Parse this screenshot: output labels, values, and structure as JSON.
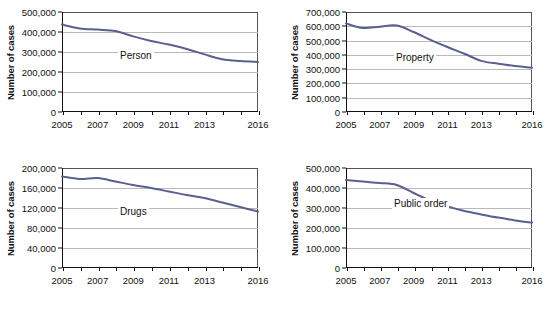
{
  "figure": {
    "layout": "2x2 grid of line charts",
    "line_color": "#5a5f8f",
    "gridline_color": "#b9b9b9",
    "axis_color": "#111111",
    "background": "#ffffff"
  },
  "chart_data": [
    {
      "type": "line",
      "title": "",
      "series_label": "Person",
      "xlabel": "",
      "ylabel": "Number of cases",
      "x": [
        2005,
        2006,
        2007,
        2008,
        2009,
        2010,
        2011,
        2012,
        2013,
        2014,
        2015,
        2016
      ],
      "values": [
        437000,
        418000,
        412000,
        405000,
        378000,
        355000,
        337000,
        315000,
        288000,
        264000,
        255000,
        250000
      ],
      "xlim": [
        2005,
        2016
      ],
      "ylim": [
        0,
        500000
      ],
      "yticks": [
        0,
        100000,
        200000,
        300000,
        400000,
        500000
      ],
      "ytick_labels": [
        "0",
        "100,000",
        "200,000",
        "300,000",
        "400,000",
        "500,000"
      ],
      "xticks": [
        2005,
        2006,
        2007,
        2008,
        2009,
        2010,
        2011,
        2012,
        2013,
        2014,
        2015,
        2016
      ],
      "xtick_labels": [
        "2005",
        "",
        "2007",
        "",
        "2009",
        "",
        "2011",
        "",
        "2013",
        "",
        "",
        "2016"
      ],
      "grid": true,
      "legend": "inline-label"
    },
    {
      "type": "line",
      "title": "",
      "series_label": "Property",
      "xlabel": "",
      "ylabel": "Number of cases",
      "x": [
        2005,
        2006,
        2007,
        2008,
        2009,
        2010,
        2011,
        2012,
        2013,
        2014,
        2015,
        2016
      ],
      "values": [
        620000,
        588000,
        597000,
        605000,
        560000,
        505000,
        455000,
        408000,
        358000,
        338000,
        322000,
        310000
      ],
      "xlim": [
        2005,
        2016
      ],
      "ylim": [
        0,
        700000
      ],
      "yticks": [
        0,
        100000,
        200000,
        300000,
        400000,
        500000,
        600000,
        700000
      ],
      "ytick_labels": [
        "0",
        "100,000",
        "200,000",
        "300,000",
        "400,000",
        "500,000",
        "600,000",
        "700,000"
      ],
      "xticks": [
        2005,
        2006,
        2007,
        2008,
        2009,
        2010,
        2011,
        2012,
        2013,
        2014,
        2015,
        2016
      ],
      "xtick_labels": [
        "2005",
        "",
        "2007",
        "",
        "2009",
        "",
        "2011",
        "",
        "2013",
        "",
        "",
        "2016"
      ],
      "grid": true,
      "legend": "inline-label"
    },
    {
      "type": "line",
      "title": "",
      "series_label": "Drugs",
      "xlabel": "",
      "ylabel": "Number of cases",
      "x": [
        2005,
        2006,
        2007,
        2008,
        2009,
        2010,
        2011,
        2012,
        2013,
        2014,
        2015,
        2016
      ],
      "values": [
        183000,
        178000,
        180000,
        173000,
        166000,
        160000,
        153000,
        146000,
        140000,
        131000,
        122000,
        113000
      ],
      "xlim": [
        2005,
        2016
      ],
      "ylim": [
        0,
        200000
      ],
      "yticks": [
        0,
        40000,
        80000,
        120000,
        160000,
        200000
      ],
      "ytick_labels": [
        "0",
        "40,000",
        "80,000",
        "120,000",
        "160,000",
        "200,000"
      ],
      "xticks": [
        2005,
        2006,
        2007,
        2008,
        2009,
        2010,
        2011,
        2012,
        2013,
        2014,
        2015,
        2016
      ],
      "xtick_labels": [
        "2005",
        "",
        "2007",
        "",
        "2009",
        "",
        "2011",
        "",
        "2013",
        "",
        "",
        "2016"
      ],
      "grid": true,
      "legend": "inline-label"
    },
    {
      "type": "line",
      "title": "",
      "series_label": "Public order",
      "xlabel": "",
      "ylabel": "Number of cases",
      "x": [
        2005,
        2006,
        2007,
        2008,
        2009,
        2010,
        2011,
        2012,
        2013,
        2014,
        2015,
        2016
      ],
      "values": [
        440000,
        432000,
        425000,
        415000,
        375000,
        337000,
        308000,
        285000,
        268000,
        252000,
        238000,
        227000
      ],
      "xlim": [
        2005,
        2016
      ],
      "ylim": [
        0,
        500000
      ],
      "yticks": [
        0,
        100000,
        200000,
        300000,
        400000,
        500000
      ],
      "ytick_labels": [
        "0",
        "100,000",
        "200,000",
        "300,000",
        "400,000",
        "500,000"
      ],
      "xticks": [
        2005,
        2006,
        2007,
        2008,
        2009,
        2010,
        2011,
        2012,
        2013,
        2014,
        2015,
        2016
      ],
      "xtick_labels": [
        "2005",
        "",
        "2007",
        "",
        "2009",
        "",
        "2011",
        "",
        "2013",
        "",
        "",
        "2016"
      ],
      "grid": true,
      "legend": "inline-label"
    }
  ]
}
